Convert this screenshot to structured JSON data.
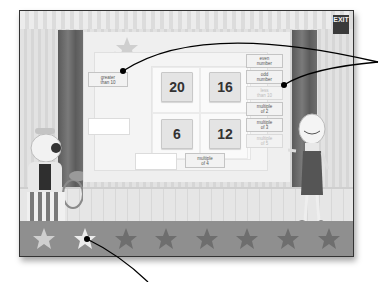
{
  "game": {
    "exit_label": "EXIT",
    "grid_numbers": [
      "20",
      "16",
      "6",
      "12"
    ],
    "left_labels": [
      {
        "line1": "greater",
        "line2": "than 10",
        "state": "placed"
      },
      {
        "line1": "",
        "line2": "",
        "state": "empty"
      }
    ],
    "bottom_labels": [
      {
        "line1": "",
        "line2": "",
        "state": "empty"
      },
      {
        "line1": "multiple",
        "line2": "of 4",
        "state": "placed"
      }
    ],
    "label_bank": [
      {
        "line1": "even",
        "line2": "number",
        "state": "available"
      },
      {
        "line1": "odd",
        "line2": "number",
        "state": "available"
      },
      {
        "line1": "less",
        "line2": "than 10",
        "state": "used"
      },
      {
        "line1": "multiple",
        "line2": "of 2",
        "state": "available"
      },
      {
        "line1": "multiple",
        "line2": "of 3",
        "state": "available"
      },
      {
        "line1": "multiple",
        "line2": "of 5",
        "state": "used"
      }
    ],
    "stars": {
      "total": 8,
      "earned": 2,
      "earned_color": "#dcdcdc",
      "unearned_color": "#6e6e6e"
    }
  }
}
